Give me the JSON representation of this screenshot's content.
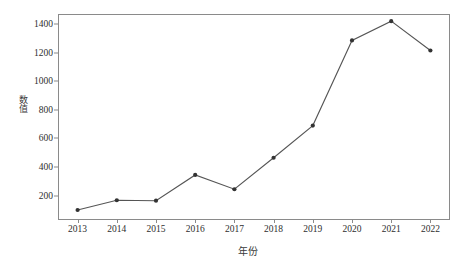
{
  "chart_data": {
    "type": "line",
    "title": "",
    "subtitle": "",
    "xlabel": "年份",
    "ylabel": "数值",
    "categories": [
      "2013",
      "2014",
      "2015",
      "2016",
      "2017",
      "2018",
      "2019",
      "2020",
      "2021",
      "2022"
    ],
    "x": [
      2013,
      2014,
      2015,
      2016,
      2017,
      2018,
      2019,
      2020,
      2021,
      2022
    ],
    "values": [
      100,
      168,
      165,
      345,
      245,
      465,
      690,
      1285,
      1420,
      1215
    ],
    "series": [
      {
        "name": "数值",
        "values": [
          100,
          168,
          165,
          345,
          245,
          465,
          690,
          1285,
          1420,
          1215
        ]
      }
    ],
    "yticks": [
      200,
      400,
      600,
      800,
      1000,
      1200,
      1400
    ],
    "ytick_labels": [
      "200",
      "400",
      "600",
      "800",
      "1000",
      "1200",
      "1400"
    ],
    "ylim": [
      30,
      1470
    ],
    "xlim": [
      2012.5,
      2022.5
    ],
    "grid": false,
    "legend": false,
    "legend_position": "none",
    "marker": "circle",
    "line_color": "#555555",
    "marker_color": "#333333",
    "axis_color": "#8a8a8a",
    "background_color": "#ffffff",
    "annotations": []
  },
  "axes": {
    "y_title": "数值",
    "x_title": "年份"
  },
  "colors": {
    "line": "#555555",
    "marker": "#333333",
    "frame": "#8a8a8a",
    "text": "#2e2e2e",
    "background": "#ffffff"
  }
}
